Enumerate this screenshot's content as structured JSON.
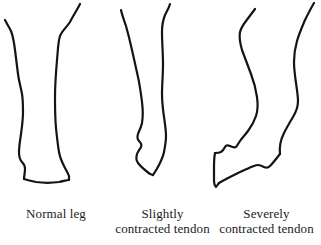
{
  "figure": {
    "background_color": "#ffffff",
    "ink_color": "#141414"
  },
  "panels": [
    {
      "id": "normal",
      "caption_lines": [
        "Normal leg"
      ],
      "description": "Outline of a normal lower leg and hoof, hoof flat on the ground"
    },
    {
      "id": "slightly",
      "caption_lines": [
        "Slightly",
        "contracted tendon"
      ],
      "description": "Outline of a leg with a slightly contracted tendon, hoof tipped onto the toe"
    },
    {
      "id": "severely",
      "caption_lines": [
        "Severely",
        "contracted tendon"
      ],
      "description": "Outline of a leg with a severely contracted tendon, fetlock knuckled over and hoof rotated backward"
    }
  ],
  "paths": {
    "normal_front": "M 80 4 C 77 10 73 16 70 22 C 66 28 62 31 60 36 C 58 42 58 50 57 60 C 56 72 55 84 55 96 C 55 108 55 118 56 128 C 57 138 58 146 59 152 C 60 158 62 162 64 166 C 66 170 68 173 69 176 L 69 180",
    "normal_back": "M 5 20 C 7 24 9 27 11 31 C 13 36 14 42 15 50 C 16 58 17 66 18 74 C 19 82 21 88 22 94 C 23 100 23 106 23 112 C 23 120 22 127 21 134 C 20 141 19 147 19 152 C 19 157 20 160 22 162 C 24 164 25 166 25 169 C 25 173 24 176 24 179",
    "normal_hoof": "M 24 179 C 27 180 31 181 36 182 C 43 183 52 183 59 182 C 64 181 67 180 69 180",
    "slightly_front": "M 170 4 C 169 8 167 11 165 15 C 163 20 162 25 162 32 C 162 42 163 53 163 64 C 163 75 162 85 162 94 C 162 103 163 110 164 117 C 165 124 166 130 166 136 C 166 142 165 147 164 152 C 163 157 161 161 159 165 C 157 169 155 172 153 175",
    "slightly_back": "M 121 10 C 122 15 124 20 126 26 C 128 33 130 41 132 50 C 134 59 136 68 138 77 C 140 86 141 94 142 102 C 143 110 143 117 142 123 C 141 128 139 131 138 134 C 137 137 137 139 139 141 C 141 143 142 145 141 147 C 140 149 138 151 137 154 C 136 157 136 160 138 163 C 141 167 146 171 150 174 L 153 175",
    "severely_front": "M 255 9 C 252 13 249 17 246 21 C 243 25 241 28 240 32 C 239 37 240 43 242 50 C 245 58 248 66 251 74 C 254 82 256 90 257 97 C 258 104 258 110 256 116 C 254 122 251 127 248 131 C 245 135 242 138 240 141 C 238 144 237 146 236 147 C 234 148 232 147 230 146 C 228 145 226 145 225 147 C 224 149 223 151 221 152 C 219 153 217 153 215 153",
    "severely_hoof_toe": "M 215 153 C 214 158 214 163 214 168 C 214 173 214 177 214 181 C 214 184 215 186 216 187 C 217 186 218 184 219 183",
    "severely_hoof_sole": "M 219 183 C 224 180 230 177 236 174 C 242 171 247 169 251 167 C 254 166 256 165 258 165 C 260 165 262 166 264 167 C 266 168 268 168 270 166 C 273 163 276 159 280 154",
    "severely_back": "M 314 3 C 311 8 308 14 305 20 C 302 27 299 34 297 41 C 295 48 294 55 294 62 C 294 69 295 76 296 83 C 297 90 298 96 298 101 C 298 107 296 112 293 117 C 290 122 287 127 284 133 C 281 139 279 145 280 154"
  }
}
